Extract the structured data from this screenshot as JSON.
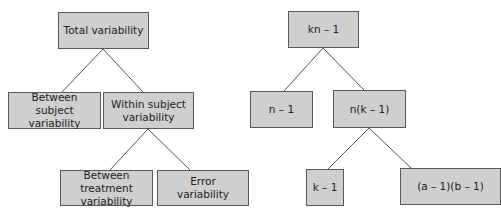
{
  "left_tree": {
    "root": {
      "label": "Total variability"
    },
    "between_subject": {
      "line1": "Between subject",
      "line2": "variability"
    },
    "within_subject": {
      "line1": "Within subject",
      "line2": "variability"
    },
    "between_treatment": {
      "line1": "Between treatment",
      "line2": "variability"
    },
    "error": {
      "line1": "Error",
      "line2": "variability"
    }
  },
  "right_tree": {
    "root": {
      "label": "kn – 1"
    },
    "between_subject_df": {
      "label": "n – 1"
    },
    "within_subject_df": {
      "label": "n(k – 1)"
    },
    "treatment_df": {
      "label": "k – 1"
    },
    "error_df": {
      "label": "(a – 1)(b – 1)"
    }
  },
  "colors": {
    "box_fill": "#cfcfcf",
    "box_border": "#5a5a5a",
    "line": "#555555"
  }
}
